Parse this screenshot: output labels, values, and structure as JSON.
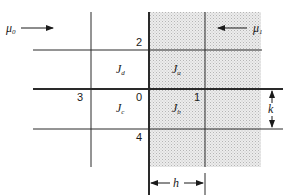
{
  "diagram": {
    "media": {
      "left": {
        "symbol": "μ",
        "subscript": "0"
      },
      "right": {
        "symbol": "μ",
        "subscript": "1"
      }
    },
    "nodes": [
      {
        "id": "0",
        "label": "0"
      },
      {
        "id": "1",
        "label": "1"
      },
      {
        "id": "2",
        "label": "2"
      },
      {
        "id": "3",
        "label": "3"
      },
      {
        "id": "4",
        "label": "4"
      }
    ],
    "regions": [
      {
        "id": "Ja",
        "symbol": "J",
        "subscript": "a"
      },
      {
        "id": "Jb",
        "symbol": "J",
        "subscript": "b"
      },
      {
        "id": "Jc",
        "symbol": "J",
        "subscript": "c"
      },
      {
        "id": "Jd",
        "symbol": "J",
        "subscript": "d"
      }
    ],
    "dimensions": {
      "horizontal": "h",
      "vertical": "k"
    },
    "colors": {
      "line": "#2a2a2a",
      "shading": "#d9d9d9"
    }
  }
}
